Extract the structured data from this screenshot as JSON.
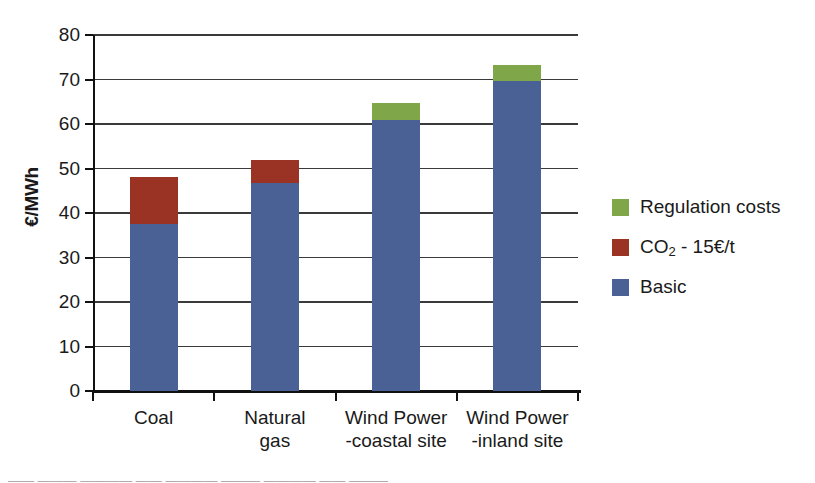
{
  "chart_data": {
    "type": "bar",
    "subtype": "stacked-bar",
    "title": "",
    "xlabel": "",
    "ylabel": "€/MWh",
    "ylim": [
      0,
      80
    ],
    "ytick_step": 10,
    "ytick_labels": [
      "80",
      "70",
      "60",
      "50",
      "40",
      "30",
      "20",
      "10",
      "0"
    ],
    "ytick_values": [
      80,
      70,
      60,
      50,
      40,
      30,
      20,
      10,
      0
    ],
    "grid": true,
    "grid_axis": "y",
    "legend_position": "right",
    "categories": [
      "Coal",
      "Natural gas",
      "Wind Power -coastal site",
      "Wind Power -inland site"
    ],
    "category_label_lines": [
      [
        "Coal",
        ""
      ],
      [
        "Natural",
        "gas"
      ],
      [
        "Wind Power",
        "-coastal site"
      ],
      [
        "Wind Power",
        "-inland site"
      ]
    ],
    "series": [
      {
        "name": "Basic",
        "color": "#4a6196",
        "values": [
          37.5,
          46.8,
          61.0,
          69.7
        ]
      },
      {
        "name": "CO₂ - 15€/t",
        "color": "#9b3324",
        "values": [
          10.5,
          5.2,
          0,
          0
        ]
      },
      {
        "name": "Regulation costs",
        "color": "#7fa74a",
        "values": [
          0,
          0,
          3.7,
          3.6
        ]
      }
    ],
    "stack_order_bottom_to_top": [
      "Basic",
      "CO₂ - 15€/t",
      "Regulation costs"
    ],
    "totals": [
      48.0,
      52.0,
      64.7,
      73.3
    ]
  },
  "axis": {
    "y_title": "€/MWh",
    "ticks": [
      {
        "label": "80",
        "value": 80
      },
      {
        "label": "70",
        "value": 70
      },
      {
        "label": "60",
        "value": 60
      },
      {
        "label": "50",
        "value": 50
      },
      {
        "label": "40",
        "value": 40
      },
      {
        "label": "30",
        "value": 30
      },
      {
        "label": "20",
        "value": 20
      },
      {
        "label": "10",
        "value": 10
      },
      {
        "label": "0",
        "value": 0
      }
    ]
  },
  "categories": [
    {
      "line1": "Coal",
      "line2": ""
    },
    {
      "line1": "Natural",
      "line2": "gas"
    },
    {
      "line1": "Wind Power",
      "line2": "-coastal site"
    },
    {
      "line1": "Wind Power",
      "line2": "-inland site"
    }
  ],
  "legend": {
    "items": [
      {
        "label_prefix": "Regulation costs",
        "label_sub": "",
        "label_suffix": "",
        "color": "#7fa74a"
      },
      {
        "label_prefix": "CO",
        "label_sub": "2",
        "label_suffix": " - 15€/t",
        "color": "#9b3324"
      },
      {
        "label_prefix": "Basic",
        "label_sub": "",
        "label_suffix": "",
        "color": "#4a6196"
      }
    ]
  },
  "colors": {
    "basic": "#4a6196",
    "co2": "#9b3324",
    "regulation": "#7fa74a",
    "axis": "#111111",
    "grid": "#3a3a3a"
  },
  "caption_artifact": "—— ——— ———— —— ———— ——— ———— —— ———"
}
